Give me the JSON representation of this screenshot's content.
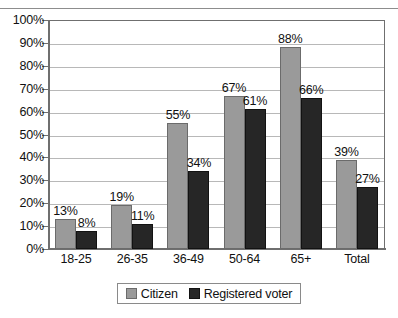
{
  "chart_data": {
    "type": "bar",
    "title": "",
    "xlabel": "",
    "ylabel": "",
    "ylim": [
      0,
      100
    ],
    "y_tick_labels": [
      "100%",
      "90%",
      "80%",
      "70%",
      "60%",
      "50%",
      "40%",
      "30%",
      "20%",
      "10%",
      "0%"
    ],
    "y_tick_values": [
      100,
      90,
      80,
      70,
      60,
      50,
      40,
      30,
      20,
      10,
      0
    ],
    "grid": true,
    "legend_position": "bottom-center",
    "categories": [
      "18-25",
      "26-35",
      "36-49",
      "50-64",
      "65+",
      "Total"
    ],
    "series": [
      {
        "name": "Citizen",
        "color": "#9a9a9a",
        "values": [
          13,
          19,
          55,
          67,
          88,
          39
        ],
        "labels": [
          "13%",
          "19%",
          "55%",
          "67%",
          "88%",
          "39%"
        ]
      },
      {
        "name": "Registered voter",
        "color": "#262626",
        "values": [
          8,
          11,
          34,
          61,
          66,
          27
        ],
        "labels": [
          "8%",
          "11%",
          "34%",
          "61%",
          "66%",
          "27%"
        ]
      }
    ]
  },
  "legend": {
    "entries": [
      {
        "label": "Citizen"
      },
      {
        "label": "Registered voter"
      }
    ]
  },
  "top_clipped_text": ""
}
